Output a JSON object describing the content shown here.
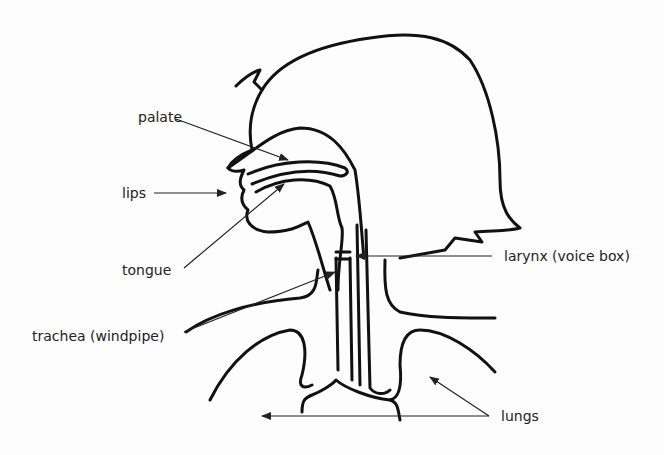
{
  "diagram": {
    "labels": {
      "palate": "palate",
      "lips": "lips",
      "tongue": "tongue",
      "larynx": "larynx (voice box)",
      "trachea": "trachea (windpipe)",
      "lungs": "lungs"
    },
    "colors": {
      "line": "#111111",
      "background": "#fdfdfd"
    }
  }
}
